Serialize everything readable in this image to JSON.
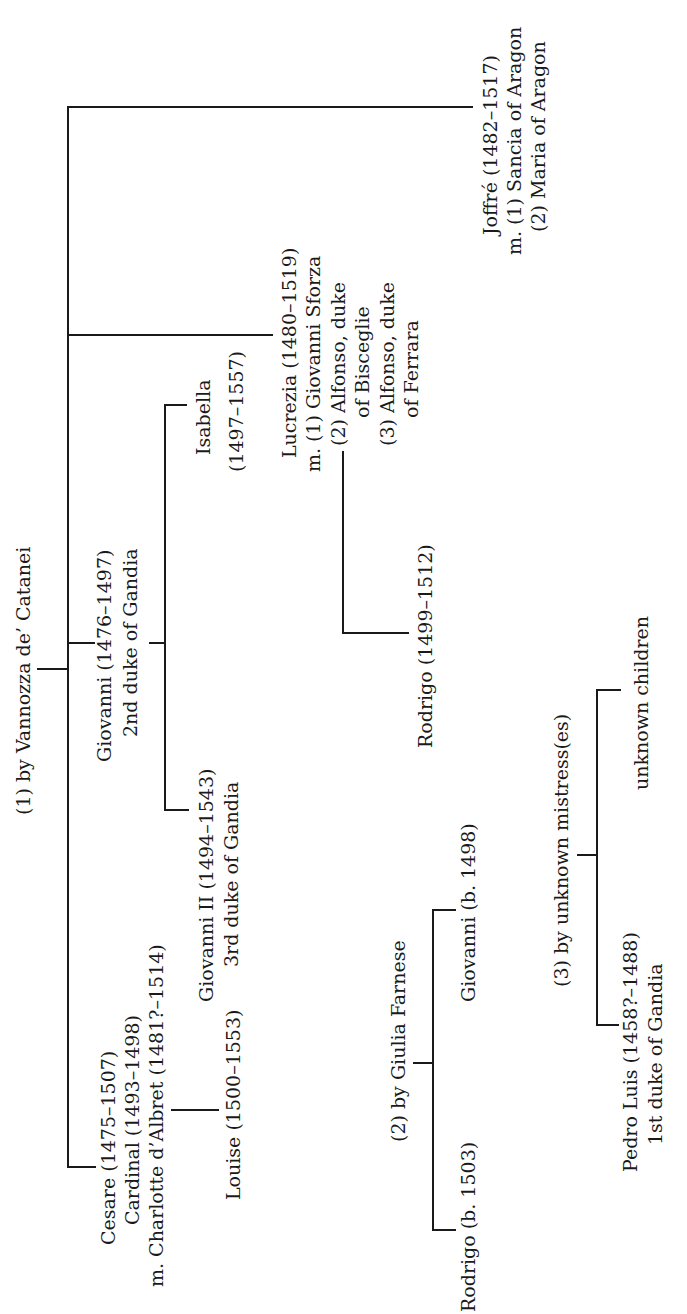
{
  "diagram": {
    "type": "family-tree",
    "orientation": "rotated-90-ccw",
    "ink_color": "#1a1a1a",
    "background": "#ffffff"
  },
  "lines": {
    "vannozza": "(1) by Vannozza de’ Catanei",
    "cesare_1": "Cesare (1475–1507)",
    "cesare_2": "Cardinal (1493–1498)",
    "cesare_3": "m. Charlotte d’Albret (1481?–1514)",
    "louise": "Louise (1500–1553)",
    "giovanni_1": "Giovanni (1476–1497)",
    "giovanni_2": "2nd duke of Gandia",
    "giovanni2_1": "Giovanni II (1494–1543)",
    "giovanni2_2": "3rd duke of Gandia",
    "isabella_1": "Isabella",
    "isabella_2": "(1497–1557)",
    "lucrezia_1": "Lucrezia (1480–1519)",
    "lucrezia_2": "m. (1) Giovanni Sforza",
    "lucrezia_3": "(2) Alfonso, duke",
    "lucrezia_4": "of Bisceglie",
    "lucrezia_5": "(3) Alfonso, duke",
    "lucrezia_6": "of Ferrara",
    "rodrigo_l": "Rodrigo (1499–1512)",
    "joffre_1": "Joffré (1482–1517)",
    "joffre_2": "m. (1) Sancia of Aragon",
    "joffre_3": "(2) Maria of Aragon",
    "farnese": "(2) by Giulia Farnese",
    "giovanni_f": "Giovanni (b. 1498)",
    "rodrigo_f": "Rodrigo (b. 1503)",
    "mistress": "(3) by unknown mistress(es)",
    "unknown_children": "unknown children",
    "pedro_1": "Pedro Luis (1458?–1488)",
    "pedro_2": "1st duke of Gandia"
  },
  "people": [
    {
      "name": "Cesare",
      "dates": "1475–1507",
      "notes": [
        "Cardinal (1493–1498)",
        "m. Charlotte d’Albret (1481?–1514)"
      ],
      "mother": "Vannozza de’ Catanei",
      "children": [
        "Louise (1500–1553)"
      ]
    },
    {
      "name": "Giovanni",
      "dates": "1476–1497",
      "notes": [
        "2nd duke of Gandia"
      ],
      "mother": "Vannozza de’ Catanei",
      "children": [
        "Giovanni II (1494–1543) 3rd duke of Gandia",
        "Isabella (1497–1557)"
      ]
    },
    {
      "name": "Lucrezia",
      "dates": "1480–1519",
      "notes": [
        "m. (1) Giovanni Sforza",
        "(2) Alfonso, duke of Bisceglie",
        "(3) Alfonso, duke of Ferrara"
      ],
      "mother": "Vannozza de’ Catanei",
      "children": [
        "Rodrigo (1499–1512)"
      ]
    },
    {
      "name": "Joffré",
      "dates": "1482–1517",
      "notes": [
        "m. (1) Sancia of Aragon",
        "(2) Maria of Aragon"
      ],
      "mother": "Vannozza de’ Catanei"
    },
    {
      "name": "Giovanni",
      "dates": "b. 1498",
      "mother": "Giulia Farnese"
    },
    {
      "name": "Rodrigo",
      "dates": "b. 1503",
      "mother": "Giulia Farnese"
    },
    {
      "name": "Pedro Luis",
      "dates": "1458?–1488",
      "notes": [
        "1st duke of Gandia"
      ],
      "mother": "unknown mistress(es)"
    },
    {
      "name": "unknown children",
      "mother": "unknown mistress(es)"
    }
  ]
}
